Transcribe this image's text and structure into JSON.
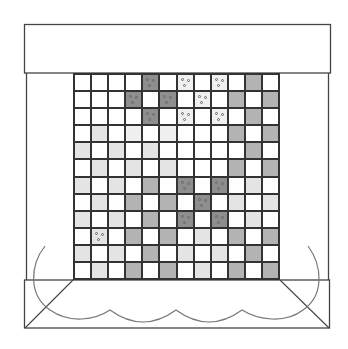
{
  "diagram": {
    "type": "quilt-pattern-diagram",
    "grid": {
      "rows": 12,
      "cols": 12,
      "legend": {
        "W": {
          "name": "white",
          "color": "#ffffff"
        },
        "X": {
          "name": "very-light-speckled",
          "color": "#f0f0f0"
        },
        "L": {
          "name": "light-gray",
          "color": "#e4e4e4"
        },
        "M": {
          "name": "medium-gray",
          "color": "#b3b3b3"
        },
        "D": {
          "name": "dark-gray",
          "color": "#8e8e8e"
        }
      },
      "cells": [
        [
          "W",
          "W",
          "W",
          "W",
          "D",
          "W",
          "X",
          "W",
          "X",
          "W",
          "M",
          "W"
        ],
        [
          "W",
          "W",
          "W",
          "D",
          "W",
          "D",
          "W",
          "X",
          "W",
          "M",
          "W",
          "M"
        ],
        [
          "W",
          "W",
          "W",
          "W",
          "D",
          "W",
          "X",
          "W",
          "X",
          "W",
          "M",
          "W"
        ],
        [
          "W",
          "L",
          "W",
          "X",
          "W",
          "X",
          "W",
          "W",
          "W",
          "M",
          "W",
          "M"
        ],
        [
          "L",
          "W",
          "L",
          "W",
          "L",
          "W",
          "W",
          "W",
          "W",
          "W",
          "M",
          "W"
        ],
        [
          "W",
          "L",
          "W",
          "L",
          "W",
          "L",
          "W",
          "W",
          "W",
          "M",
          "W",
          "M"
        ],
        [
          "L",
          "W",
          "L",
          "W",
          "M",
          "W",
          "D",
          "W",
          "D",
          "W",
          "L",
          "W"
        ],
        [
          "W",
          "L",
          "W",
          "M",
          "W",
          "M",
          "W",
          "D",
          "W",
          "L",
          "W",
          "L"
        ],
        [
          "L",
          "W",
          "L",
          "W",
          "M",
          "W",
          "D",
          "W",
          "D",
          "W",
          "L",
          "W"
        ],
        [
          "W",
          "L",
          "W",
          "M",
          "W",
          "M",
          "W",
          "L",
          "W",
          "M",
          "W",
          "M"
        ],
        [
          "L",
          "W",
          "L",
          "W",
          "M",
          "W",
          "L",
          "W",
          "L",
          "W",
          "M",
          "W"
        ],
        [
          "W",
          "L",
          "W",
          "M",
          "W",
          "M",
          "W",
          "L",
          "W",
          "M",
          "W",
          "M"
        ]
      ],
      "dotted_cells": [
        [
          0,
          4
        ],
        [
          0,
          6
        ],
        [
          0,
          8
        ],
        [
          1,
          3
        ],
        [
          1,
          5
        ],
        [
          1,
          7
        ],
        [
          2,
          4
        ],
        [
          2,
          6
        ],
        [
          2,
          8
        ],
        [
          6,
          6
        ],
        [
          6,
          8
        ],
        [
          7,
          7
        ],
        [
          8,
          6
        ],
        [
          8,
          8
        ],
        [
          9,
          1
        ]
      ]
    },
    "top_banner": {
      "label": ""
    },
    "bottom_band": {
      "label": ""
    },
    "colors": {
      "stroke": "#333333",
      "curve": "#777777"
    }
  }
}
